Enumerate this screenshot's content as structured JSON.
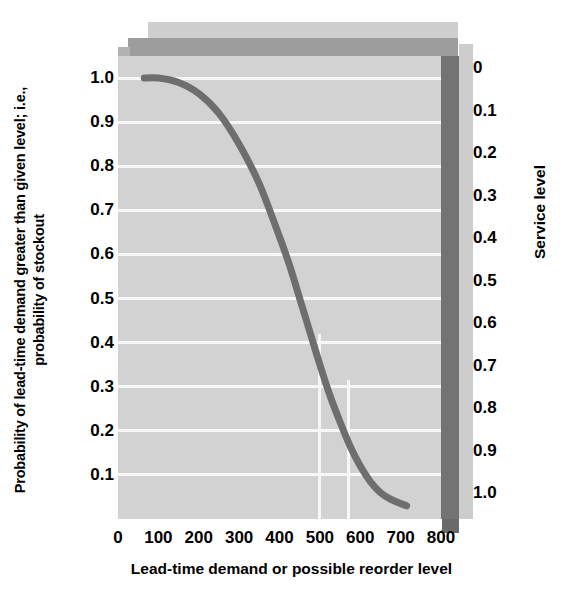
{
  "chart_data": {
    "type": "line",
    "title": "",
    "xlabel": "Lead-time demand or possible reorder level",
    "ylabel": "Probability of lead-time demand greater than given level; i.e., probability of stockout",
    "secondary_ylabel": "Service level",
    "xlim": [
      0,
      800
    ],
    "ylim": [
      0,
      1.05
    ],
    "secondary_ylim": [
      0,
      1.0
    ],
    "grid": "horizontal-major plus partial vertical",
    "legend": "none",
    "xticks": [
      "0",
      "100",
      "200",
      "300",
      "400",
      "500",
      "600",
      "700",
      "800"
    ],
    "xtick_values": [
      0,
      100,
      200,
      300,
      400,
      500,
      600,
      700,
      800
    ],
    "yticks": [
      "1.0",
      "0.9",
      "0.8",
      "0.7",
      "0.6",
      "0.5",
      "0.4",
      "0.3",
      "0.2",
      "0.1"
    ],
    "ytick_values": [
      1.0,
      0.9,
      0.8,
      0.7,
      0.6,
      0.5,
      0.4,
      0.3,
      0.2,
      0.1
    ],
    "secondary_yticks": [
      "0",
      "0.1",
      "0.2",
      "0.3",
      "0.4",
      "0.5",
      "0.6",
      "0.7",
      "0.8",
      "0.9",
      "1.0"
    ],
    "secondary_ytick_values": [
      0,
      0.1,
      0.2,
      0.3,
      0.4,
      0.5,
      0.6,
      0.7,
      0.8,
      0.9,
      1.0
    ],
    "series": [
      {
        "name": "Probability of stockout",
        "color": "#6e6e6e",
        "x": [
          65,
          100,
          150,
          200,
          250,
          300,
          350,
          400,
          425,
          450,
          475,
          500,
          525,
          550,
          575,
          600,
          625,
          650,
          675,
          700,
          715
        ],
        "y": [
          1.0,
          1.0,
          0.99,
          0.965,
          0.92,
          0.85,
          0.76,
          0.64,
          0.575,
          0.5,
          0.425,
          0.35,
          0.28,
          0.22,
          0.165,
          0.12,
          0.085,
          0.06,
          0.045,
          0.035,
          0.03
        ]
      }
    ]
  },
  "axes": {
    "y_title": "Probability of lead-time demand greater than given level; i.e., probability of stockout",
    "x_title": "Lead-time demand or possible reorder level",
    "secondary_title": "Service level"
  },
  "colors": {
    "plot_background": "#d2d2d2",
    "gridline": "#f7f7f7",
    "curve": "#6e6e6e",
    "top_face": "#9d9d9d",
    "top_shadow": "#cfcfcf",
    "right_wall": "#737373",
    "service_panel": "#cdcdcd",
    "text": "#000000",
    "page_background": "#ffffff"
  }
}
